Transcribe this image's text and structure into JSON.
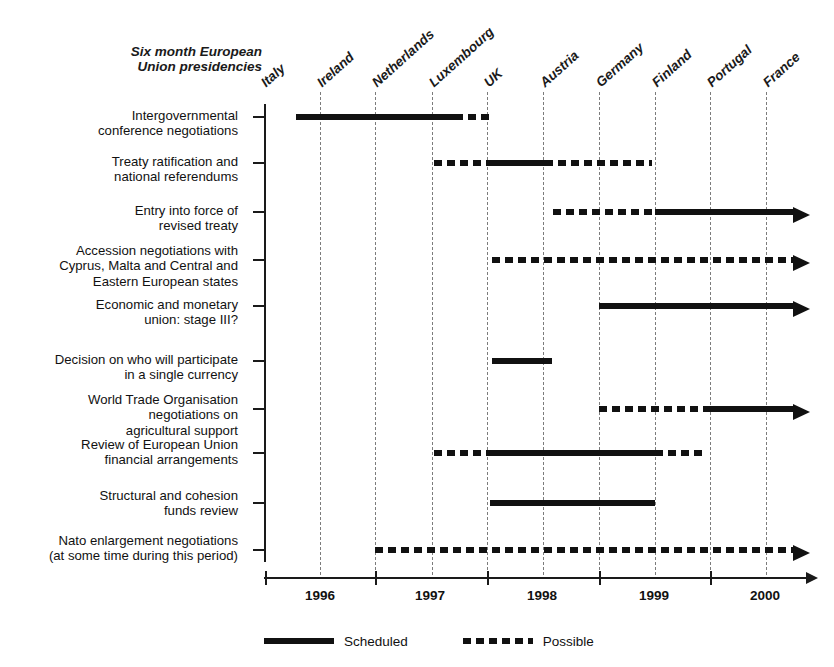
{
  "header": {
    "caption_line1": "Six month European",
    "caption_line2": "Union presidencies"
  },
  "presidencies": [
    {
      "label": "Italy",
      "x": 264
    },
    {
      "label": "Ireland",
      "x": 320
    },
    {
      "label": "Netherlands",
      "x": 375
    },
    {
      "label": "Luxembourg",
      "x": 432
    },
    {
      "label": "UK",
      "x": 487
    },
    {
      "label": "Austria",
      "x": 543
    },
    {
      "label": "Germany",
      "x": 599
    },
    {
      "label": "Finland",
      "x": 655
    },
    {
      "label": "Portugal",
      "x": 710
    },
    {
      "label": "France",
      "x": 766
    }
  ],
  "years": [
    "1996",
    "1997",
    "1998",
    "1999",
    "2000"
  ],
  "legend": {
    "scheduled_label": "Scheduled",
    "possible_label": "Possible"
  },
  "chart_data": {
    "type": "bar",
    "title": "",
    "xlabel": "",
    "ylabel": "",
    "grid": true,
    "legend_position": "bottom",
    "x_axis": {
      "type": "time",
      "tick_labels": [
        "1996",
        "1997",
        "1998",
        "1999",
        "2000"
      ],
      "tick_years": [
        1996,
        1997,
        1998,
        1999,
        2000
      ],
      "minor_ticks": "six-month EU presidency boundaries",
      "range": [
        "1995-07",
        "2000-10"
      ]
    },
    "series_types": [
      "Scheduled",
      "Possible"
    ],
    "categories": [
      "Intergovernmental conference negotiations",
      "Treaty ratification and national referendums",
      "Entry into force of revised treaty",
      "Accession negotiations with Cyprus, Malta and Central and Eastern European states",
      "Economic and monetary union: stage III?",
      "Decision on who will participate in a single currency",
      "World Trade Organisation negotiations on agricultural support",
      "Review of European Union financial arrangements",
      "Structural and cohesion funds review",
      "Nato enlargement negotiations (at some time during this period)"
    ],
    "rows": [
      {
        "label_lines": [
          "Intergovernmental",
          "conference negotiations"
        ],
        "y": 114,
        "label_y": 108,
        "segments": [
          {
            "kind": "solid",
            "start": 296,
            "end": 455,
            "start_period": "1995-H2",
            "end_period": "1997-H1"
          },
          {
            "kind": "dash",
            "start": 455,
            "end": 489,
            "start_period": "1997-H1",
            "end_period": "1997-H2"
          }
        ],
        "arrow": false
      },
      {
        "label_lines": [
          "Treaty ratification and",
          "national referendums"
        ],
        "y": 160,
        "label_y": 154,
        "segments": [
          {
            "kind": "dash",
            "start": 434,
            "end": 488,
            "start_period": "1997-H1",
            "end_period": "1997-H2"
          },
          {
            "kind": "solid",
            "start": 488,
            "end": 545,
            "start_period": "1997-H2",
            "end_period": "1998-H1"
          },
          {
            "kind": "dash",
            "start": 545,
            "end": 652,
            "start_period": "1998-H1",
            "end_period": "1999-H1"
          }
        ],
        "arrow": false
      },
      {
        "label_lines": [
          "Entry into force of",
          "revised treaty"
        ],
        "y": 209,
        "label_y": 203,
        "segments": [
          {
            "kind": "dash",
            "start": 553,
            "end": 655,
            "start_period": "1998-H1",
            "end_period": "1999-H1"
          },
          {
            "kind": "solid",
            "start": 655,
            "end": 793,
            "start_period": "1999-H1",
            "end_period": "open"
          }
        ],
        "arrow": true
      },
      {
        "label_lines": [
          "Accession negotiations with",
          "Cyprus, Malta and Central and",
          "Eastern European states"
        ],
        "y": 257,
        "label_y": 243,
        "segments": [
          {
            "kind": "dash",
            "start": 492,
            "end": 793,
            "start_period": "1997-H2",
            "end_period": "open"
          }
        ],
        "arrow": true
      },
      {
        "label_lines": [
          "Economic and monetary",
          "union: stage III?"
        ],
        "y": 303,
        "label_y": 297,
        "segments": [
          {
            "kind": "solid",
            "start": 599,
            "end": 793,
            "start_period": "1998-H2",
            "end_period": "open"
          }
        ],
        "arrow": true
      },
      {
        "label_lines": [
          "Decision on who will participate",
          "in a single currency"
        ],
        "y": 358,
        "label_y": 352,
        "segments": [
          {
            "kind": "solid",
            "start": 492,
            "end": 552,
            "start_period": "1997-H2",
            "end_period": "1998-H1"
          }
        ],
        "arrow": false
      },
      {
        "label_lines": [
          "World Trade Organisation",
          "negotiations on",
          "agricultural support"
        ],
        "y": 406,
        "label_y": 392,
        "segments": [
          {
            "kind": "dash",
            "start": 599,
            "end": 708,
            "start_period": "1998-H2",
            "end_period": "2000-H1"
          },
          {
            "kind": "solid",
            "start": 708,
            "end": 793,
            "start_period": "2000-H1",
            "end_period": "open"
          }
        ],
        "arrow": true
      },
      {
        "label_lines": [
          "Review of European Union",
          "financial arrangements"
        ],
        "y": 450,
        "label_y": 437,
        "segments": [
          {
            "kind": "dash",
            "start": 434,
            "end": 487,
            "start_period": "1997-H1",
            "end_period": "1997-H2"
          },
          {
            "kind": "solid",
            "start": 487,
            "end": 655,
            "start_period": "1997-H2",
            "end_period": "1999-H1"
          },
          {
            "kind": "dash",
            "start": 655,
            "end": 707,
            "start_period": "1999-H1",
            "end_period": "1999-H2"
          }
        ],
        "arrow": false
      },
      {
        "label_lines": [
          "Structural and cohesion",
          "funds review"
        ],
        "y": 500,
        "label_y": 488,
        "segments": [
          {
            "kind": "solid",
            "start": 490,
            "end": 655,
            "start_period": "1997-H2",
            "end_period": "1999-H1"
          }
        ],
        "arrow": false
      },
      {
        "label_lines": [
          "Nato enlargement negotiations",
          "(at some time during this period)"
        ],
        "y": 547,
        "label_y": 533,
        "segments": [
          {
            "kind": "dash",
            "start": 375,
            "end": 793,
            "start_period": "1996-H2",
            "end_period": "open"
          }
        ],
        "arrow": true
      }
    ]
  }
}
